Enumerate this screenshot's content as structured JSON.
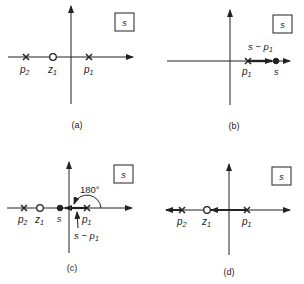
{
  "panels": [
    {
      "id": "a",
      "caption": "(a)",
      "plane_label": "s",
      "poles": [
        {
          "label": "p",
          "sub": "2"
        },
        {
          "label": "p",
          "sub": "1"
        }
      ],
      "zeros": [
        {
          "label": "z",
          "sub": "1"
        }
      ]
    },
    {
      "id": "b",
      "caption": "(b)",
      "plane_label": "s",
      "poles": [
        {
          "label": "p",
          "sub": "1"
        }
      ],
      "test_point": "s",
      "vector_label": "s − p",
      "vector_sub": "1"
    },
    {
      "id": "c",
      "caption": "(c)",
      "plane_label": "s",
      "poles": [
        {
          "label": "p",
          "sub": "2"
        },
        {
          "label": "p",
          "sub": "1"
        }
      ],
      "zeros": [
        {
          "label": "z",
          "sub": "1"
        }
      ],
      "test_point": "s",
      "angle_label": "180°",
      "vector_label": "s − p",
      "vector_sub": "1"
    },
    {
      "id": "d",
      "caption": "(d)",
      "plane_label": "s",
      "poles": [
        {
          "label": "p",
          "sub": "2"
        },
        {
          "label": "p",
          "sub": "1"
        }
      ],
      "zeros": [
        {
          "label": "z",
          "sub": "1"
        }
      ]
    }
  ]
}
